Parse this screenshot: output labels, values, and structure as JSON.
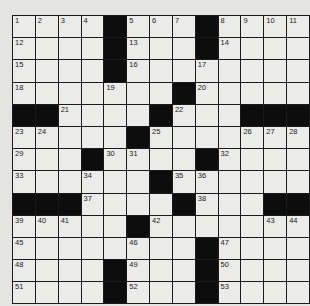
{
  "puzzle": {
    "rows": 13,
    "cols": 13,
    "colors": {
      "background": "#e4e4e2",
      "cell": "#ebebe9",
      "block": "#0d0d0d",
      "line": "#1a1a1a"
    },
    "grid": [
      [
        "1",
        "2",
        "3",
        "4",
        "#",
        "5",
        "6",
        "7",
        "#",
        "8",
        "9",
        "10",
        "11"
      ],
      [
        "12",
        "",
        "",
        "",
        "#",
        "13",
        "",
        "",
        "#",
        "14",
        "",
        "",
        ""
      ],
      [
        "15",
        "",
        "",
        "",
        "#",
        "16",
        "",
        "",
        "17",
        "",
        "",
        "",
        ""
      ],
      [
        "18",
        "",
        "",
        "",
        "19",
        "",
        "",
        "#",
        "20",
        "",
        "",
        "",
        ""
      ],
      [
        "#",
        "#",
        "21",
        "",
        "",
        "",
        "#",
        "22",
        "",
        "",
        "#",
        "#",
        "#"
      ],
      [
        "23",
        "24",
        "",
        "",
        "",
        "#",
        "25",
        "",
        "",
        "",
        "26",
        "27",
        "28"
      ],
      [
        "29",
        "",
        "",
        "#",
        "30",
        "31",
        "",
        "",
        "#",
        "32",
        "",
        "",
        ""
      ],
      [
        "33",
        "",
        "",
        "34",
        "",
        "",
        "#",
        "35",
        "36",
        "",
        "",
        "",
        ""
      ],
      [
        "#",
        "#",
        "#",
        "37",
        "",
        "",
        "",
        "#",
        "38",
        "",
        "",
        "#",
        "#"
      ],
      [
        "39",
        "40",
        "41",
        "",
        "",
        "#",
        "42",
        "",
        "",
        "",
        "",
        "43",
        "44"
      ],
      [
        "45",
        "",
        "",
        "",
        "",
        "46",
        "",
        "",
        "#",
        "47",
        "",
        "",
        ""
      ],
      [
        "48",
        "",
        "",
        "",
        "#",
        "49",
        "",
        "",
        "#",
        "50",
        "",
        "",
        ""
      ],
      [
        "51",
        "",
        "",
        "",
        "#",
        "52",
        "",
        "",
        "#",
        "53",
        "",
        "",
        ""
      ]
    ]
  }
}
